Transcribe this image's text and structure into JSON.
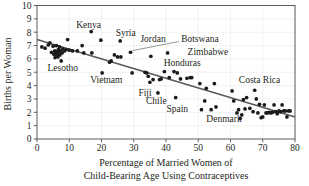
{
  "chart_data": {
    "type": "scatter",
    "title": "",
    "xlabel": "Percentage of Married Women of Child-Bearing Age Using Contraceptives",
    "xlabel_lines": [
      "Percentage of Married Women of",
      "Child-Bearing Age Using Contraceptives"
    ],
    "ylabel": "Births per Woman",
    "xlim": [
      0,
      80
    ],
    "ylim": [
      0,
      10
    ],
    "xticks": [
      0,
      10,
      20,
      30,
      40,
      50,
      60,
      70,
      80
    ],
    "yticks": [
      0,
      1,
      2,
      3,
      4,
      5,
      6,
      7,
      8,
      9,
      10
    ],
    "grid": true,
    "legend": "none",
    "trendline": {
      "type": "linear",
      "x_start": 0,
      "y_start": 7.45,
      "x_end": 80,
      "y_end": 1.65
    },
    "points": [
      {
        "x": 1.5,
        "y": 6.9
      },
      {
        "x": 2.5,
        "y": 6.8
      },
      {
        "x": 3.5,
        "y": 7.05
      },
      {
        "x": 4.0,
        "y": 7.2
      },
      {
        "x": 4.5,
        "y": 6.5
      },
      {
        "x": 5.0,
        "y": 6.95
      },
      {
        "x": 5.2,
        "y": 6.35
      },
      {
        "x": 5.5,
        "y": 6.6
      },
      {
        "x": 5.6,
        "y": 6.1
      },
      {
        "x": 5.8,
        "y": 6.45
      },
      {
        "x": 6.0,
        "y": 7.0
      },
      {
        "x": 6.1,
        "y": 6.25
      },
      {
        "x": 6.3,
        "y": 6.55
      },
      {
        "x": 6.5,
        "y": 6.15
      },
      {
        "x": 6.6,
        "y": 6.7
      },
      {
        "x": 6.8,
        "y": 6.4
      },
      {
        "x": 7.0,
        "y": 6.9
      },
      {
        "x": 7.1,
        "y": 6.3
      },
      {
        "x": 7.3,
        "y": 6.6
      },
      {
        "x": 7.5,
        "y": 5.85
      },
      {
        "x": 7.8,
        "y": 6.45
      },
      {
        "x": 8.0,
        "y": 6.75
      },
      {
        "x": 8.5,
        "y": 6.6
      },
      {
        "x": 9.0,
        "y": 6.7
      },
      {
        "x": 9.5,
        "y": 7.45
      },
      {
        "x": 10.0,
        "y": 6.65
      },
      {
        "x": 11.0,
        "y": 6.6
      },
      {
        "x": 12.5,
        "y": 6.6
      },
      {
        "x": 14.0,
        "y": 7.0
      },
      {
        "x": 14.5,
        "y": 6.45
      },
      {
        "x": 16.8,
        "y": 8.05
      },
      {
        "x": 17.0,
        "y": 6.45
      },
      {
        "x": 19.8,
        "y": 7.4
      },
      {
        "x": 20.2,
        "y": 4.95
      },
      {
        "x": 22.5,
        "y": 5.75
      },
      {
        "x": 23.0,
        "y": 5.85
      },
      {
        "x": 24.0,
        "y": 6.3
      },
      {
        "x": 25.0,
        "y": 6.15
      },
      {
        "x": 25.8,
        "y": 7.35
      },
      {
        "x": 26.0,
        "y": 6.15
      },
      {
        "x": 29.0,
        "y": 6.5
      },
      {
        "x": 29.5,
        "y": 4.95
      },
      {
        "x": 33.5,
        "y": 5.0
      },
      {
        "x": 34.0,
        "y": 4.95
      },
      {
        "x": 34.5,
        "y": 4.7
      },
      {
        "x": 35.0,
        "y": 4.25
      },
      {
        "x": 35.3,
        "y": 6.2
      },
      {
        "x": 36.0,
        "y": 4.45
      },
      {
        "x": 37.5,
        "y": 3.45
      },
      {
        "x": 38.0,
        "y": 4.45
      },
      {
        "x": 38.5,
        "y": 4.5
      },
      {
        "x": 39.5,
        "y": 5.05
      },
      {
        "x": 40.5,
        "y": 6.45
      },
      {
        "x": 41.0,
        "y": 4.6
      },
      {
        "x": 42.5,
        "y": 5.05
      },
      {
        "x": 43.0,
        "y": 3.1
      },
      {
        "x": 43.5,
        "y": 4.95
      },
      {
        "x": 44.5,
        "y": 4.5
      },
      {
        "x": 46.5,
        "y": 4.55
      },
      {
        "x": 47.5,
        "y": 4.6
      },
      {
        "x": 48.0,
        "y": 4.6
      },
      {
        "x": 50.5,
        "y": 4.15
      },
      {
        "x": 51.0,
        "y": 2.2
      },
      {
        "x": 52.0,
        "y": 2.85
      },
      {
        "x": 52.5,
        "y": 3.8
      },
      {
        "x": 54.0,
        "y": 2.2
      },
      {
        "x": 55.0,
        "y": 4.15
      },
      {
        "x": 55.5,
        "y": 2.4
      },
      {
        "x": 60.5,
        "y": 3.6
      },
      {
        "x": 61.0,
        "y": 2.85
      },
      {
        "x": 62.0,
        "y": 1.95
      },
      {
        "x": 62.5,
        "y": 2.2
      },
      {
        "x": 63.0,
        "y": 1.55
      },
      {
        "x": 63.5,
        "y": 1.8
      },
      {
        "x": 64.0,
        "y": 2.95
      },
      {
        "x": 64.5,
        "y": 2.25
      },
      {
        "x": 65.0,
        "y": 3.1
      },
      {
        "x": 66.0,
        "y": 2.3
      },
      {
        "x": 67.0,
        "y": 2.05
      },
      {
        "x": 67.5,
        "y": 3.65
      },
      {
        "x": 68.0,
        "y": 3.0
      },
      {
        "x": 68.5,
        "y": 1.95
      },
      {
        "x": 69.0,
        "y": 2.6
      },
      {
        "x": 69.5,
        "y": 1.6
      },
      {
        "x": 70.0,
        "y": 1.65
      },
      {
        "x": 70.5,
        "y": 2.55
      },
      {
        "x": 71.0,
        "y": 1.95
      },
      {
        "x": 71.5,
        "y": 1.95
      },
      {
        "x": 72.0,
        "y": 2.0
      },
      {
        "x": 72.5,
        "y": 1.95
      },
      {
        "x": 73.0,
        "y": 2.0
      },
      {
        "x": 73.5,
        "y": 2.55
      },
      {
        "x": 74.0,
        "y": 2.05
      },
      {
        "x": 74.5,
        "y": 1.9
      },
      {
        "x": 75.0,
        "y": 2.1
      },
      {
        "x": 75.5,
        "y": 2.05
      },
      {
        "x": 76.0,
        "y": 2.55
      },
      {
        "x": 76.5,
        "y": 2.1
      },
      {
        "x": 77.0,
        "y": 2.1
      },
      {
        "x": 77.5,
        "y": 1.65
      },
      {
        "x": 78.0,
        "y": 2.1
      },
      {
        "x": 78.5,
        "y": 2.1
      }
    ],
    "annotations": [
      {
        "name": "Kenya",
        "text": "Kenya",
        "lx": 16.0,
        "ly": 8.55,
        "anchor": "middle"
      },
      {
        "name": "Syria",
        "text": "Syria",
        "lx": 27.5,
        "ly": 8.0,
        "anchor": "middle"
      },
      {
        "name": "Jordan",
        "text": "Jordan",
        "lx": 36.0,
        "ly": 7.55,
        "anchor": "middle"
      },
      {
        "name": "Botswana",
        "text": "Botswana",
        "lx": 50.5,
        "ly": 7.5,
        "anchor": "middle",
        "leader": {
          "x1": 44.0,
          "y1": 7.3,
          "x2": 29.6,
          "y2": 6.62
        }
      },
      {
        "name": "Zimbabwe",
        "text": "Zimbabwe",
        "lx": 53.0,
        "ly": 6.55,
        "anchor": "middle"
      },
      {
        "name": "Honduras",
        "text": "Honduras",
        "lx": 45.0,
        "ly": 5.75,
        "anchor": "middle"
      },
      {
        "name": "Lesotho",
        "text": "Lesotho",
        "lx": 8.0,
        "ly": 5.35,
        "anchor": "middle"
      },
      {
        "name": "Vietnam",
        "text": "Vietnam",
        "lx": 21.5,
        "ly": 4.45,
        "anchor": "middle"
      },
      {
        "name": "Costa Rica",
        "text": "Costa Rica",
        "lx": 69.0,
        "ly": 4.45,
        "anchor": "middle"
      },
      {
        "name": "Fiji",
        "text": "Fiji",
        "lx": 33.5,
        "ly": 3.45,
        "anchor": "middle"
      },
      {
        "name": "Chile",
        "text": "Chile",
        "lx": 37.0,
        "ly": 2.85,
        "anchor": "middle"
      },
      {
        "name": "Spain",
        "text": "Spain",
        "lx": 43.5,
        "ly": 2.3,
        "anchor": "middle"
      },
      {
        "name": "Denmark",
        "text": "Denmark",
        "lx": 58.0,
        "ly": 1.5,
        "anchor": "middle"
      }
    ]
  }
}
